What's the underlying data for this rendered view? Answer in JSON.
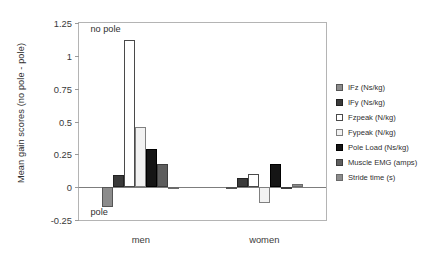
{
  "chart_data": {
    "type": "bar",
    "title": "",
    "xlabel": "",
    "ylabel": "Mean gain scores (no pole - pole)",
    "categories": [
      "men",
      "women"
    ],
    "ylim": [
      -0.25,
      1.25
    ],
    "yticks": [
      "-0.25",
      "0",
      "0.25",
      "0.5",
      "0.75",
      "1",
      "1.25"
    ],
    "ytick_values": [
      -0.25,
      0,
      0.25,
      0.5,
      0.75,
      1,
      1.25
    ],
    "grid": false,
    "legend_position": "right",
    "annotations": [
      {
        "text": "no pole",
        "x_category": "men",
        "y": 1.2
      },
      {
        "text": "pole",
        "x_category": "men",
        "y": -0.2
      }
    ],
    "series": [
      {
        "name": "IFz (Ns/kg)",
        "fill": "#8c8c8c",
        "edge": "#555555",
        "values": [
          -0.15,
          -0.012
        ]
      },
      {
        "name": "IFy (Ns/kg)",
        "fill": "#3a3a3a",
        "edge": "#222222",
        "values": [
          0.09,
          0.07
        ]
      },
      {
        "name": "Fzpeak (N/kg)",
        "fill": "#ffffff",
        "edge": "#4a4a4a",
        "values": [
          1.12,
          0.1
        ]
      },
      {
        "name": "Fypeak (N/kg)",
        "fill": "#f2f2f2",
        "edge": "#808080",
        "values": [
          0.46,
          -0.12
        ]
      },
      {
        "name": "Pole Load (Ns/kg)",
        "fill": "#151515",
        "edge": "#000000",
        "values": [
          0.29,
          0.18
        ]
      },
      {
        "name": "Muscle EMG (amps)",
        "fill": "#5e5e5e",
        "edge": "#3d3d3d",
        "values": [
          0.18,
          -0.012
        ]
      },
      {
        "name": "Stride time (s)",
        "fill": "#8c8c8c",
        "edge": "#6a6a6a",
        "values": [
          -0.012,
          0.022
        ]
      }
    ]
  },
  "legend": {
    "items": [
      "IFz (Ns/kg)",
      "IFy (Ns/kg)",
      "Fzpeak (N/kg)",
      "Fypeak (N/kg)",
      "Pole Load (Ns/kg)",
      "Muscle EMG (amps)",
      "Stride time (s)"
    ]
  }
}
